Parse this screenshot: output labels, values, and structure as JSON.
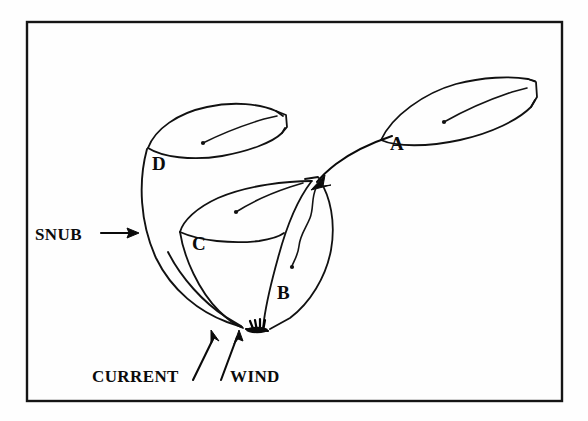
{
  "figure": {
    "title_hidden": "",
    "background_color": "#fefefe",
    "ink_color": "#111111",
    "frame": {
      "name": "diagram-border",
      "x": 27,
      "y": 22,
      "width": 535,
      "height": 379
    },
    "boat_labels": [
      {
        "id": "A",
        "text": "A",
        "x": 390,
        "y": 150
      },
      {
        "id": "B",
        "text": "B",
        "x": 277,
        "y": 299
      },
      {
        "id": "C",
        "text": "C",
        "x": 192,
        "y": 250
      },
      {
        "id": "D",
        "text": "D",
        "x": 152,
        "y": 170
      }
    ],
    "annotations": [
      {
        "id": "snub",
        "text": "SNUB",
        "x": 35,
        "y": 240
      },
      {
        "id": "current",
        "text": "CURRENT",
        "x": 92,
        "y": 382
      },
      {
        "id": "wind",
        "text": "WIND",
        "x": 230,
        "y": 382
      }
    ],
    "icon_names": {
      "snub_arrow": "arrow-right-icon",
      "current_arrow": "arrow-up-right-icon",
      "wind_arrow": "arrow-up-icon",
      "swing_arrow": "curved-arrow-icon",
      "anchor": "anchor-icon"
    }
  }
}
